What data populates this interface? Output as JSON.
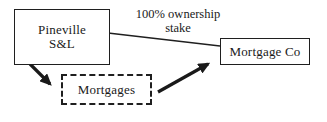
{
  "diagram": {
    "nodes": {
      "pineville": {
        "lines": [
          "Pineville",
          "S&L"
        ],
        "border_style": "solid"
      },
      "mortgage_co": {
        "label": "Mortgage Co",
        "border_style": "solid"
      },
      "mortgages": {
        "label": "Mortgages",
        "border_style": "dashed"
      }
    },
    "edges": {
      "ownership": {
        "label_lines": [
          "100% ownership",
          "stake"
        ],
        "from": "Pineville S&L",
        "to": "Mortgage Co",
        "style": "thin-line"
      },
      "pineville_to_mortgages": {
        "from": "Pineville S&L",
        "to": "Mortgages",
        "style": "thick-arrow"
      },
      "mortgages_to_mortgage_co": {
        "from": "Mortgages",
        "to": "Mortgage Co",
        "style": "thick-arrow"
      }
    },
    "colors": {
      "stroke": "#1f1f1f",
      "text": "#1a1a1a",
      "background": "#ffffff"
    }
  }
}
